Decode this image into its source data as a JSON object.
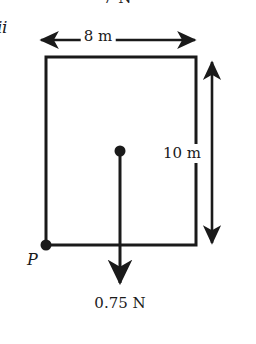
{
  "figure": {
    "kind": "free-body-diagram",
    "background_color": "#ffffff",
    "stroke_color": "#1a1a1a",
    "labels": {
      "top_force": "7 N",
      "item_marker": "ii",
      "width": "8 m",
      "height": "10 m",
      "weight": "0.75 N",
      "point_p": "P"
    },
    "shape": {
      "name": "rectangle-lamina",
      "left": 46,
      "right": 196,
      "top": 57,
      "bottom": 245,
      "stroke_width": 3
    },
    "dimensions": [
      {
        "name": "width-dimension",
        "orientation": "horizontal",
        "label": "8 m",
        "value": 8,
        "unit": "m",
        "from": [
          40,
          40
        ],
        "to": [
          196,
          40
        ]
      },
      {
        "name": "height-dimension",
        "orientation": "vertical",
        "label": "10 m",
        "value": 10,
        "unit": "m",
        "from": [
          212,
          60
        ],
        "to": [
          212,
          245
        ]
      }
    ],
    "points": [
      {
        "name": "centre-of-mass",
        "label": "",
        "x": 120,
        "y": 151,
        "radius": 5.5
      },
      {
        "name": "point-p",
        "label": "P",
        "x": 46,
        "y": 245,
        "radius": 5.5
      }
    ],
    "forces": [
      {
        "name": "weight-force",
        "label": "0.75 N",
        "magnitude": 0.75,
        "unit": "N",
        "direction": "down",
        "from": [
          120,
          151
        ],
        "to": [
          120,
          288
        ]
      },
      {
        "name": "top-force",
        "label": "7 N",
        "magnitude": 7,
        "unit": "N",
        "direction": "clipped-above-frame"
      }
    ]
  }
}
